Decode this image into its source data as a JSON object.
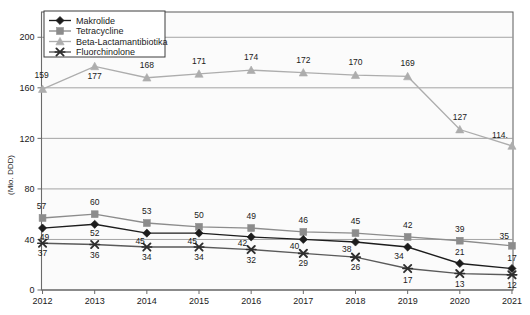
{
  "chart_data": {
    "type": "line",
    "title": "",
    "xlabel": "",
    "ylabel": "(Mio. DDD)",
    "categories": [
      "2012",
      "2013",
      "2014",
      "2015",
      "2016",
      "2017",
      "2018",
      "2019",
      "2020",
      "2021"
    ],
    "x": [
      2012,
      2013,
      2014,
      2015,
      2016,
      2017,
      2018,
      2019,
      2020,
      2021
    ],
    "ylim": [
      0,
      220
    ],
    "yticks": [
      0,
      40,
      80,
      120,
      160,
      200
    ],
    "ytick_labels": [
      "0",
      "40",
      "80",
      "120",
      "160",
      "200"
    ],
    "grid": true,
    "legend_position": "top-left",
    "series": [
      {
        "name": "Makrolide",
        "marker": "diamond",
        "color": "#1c1c1c",
        "line_color": "#1c1c1c",
        "values": [
          49,
          52,
          45,
          45,
          42,
          40,
          38,
          34,
          21,
          17
        ],
        "labels": [
          "49",
          "52",
          "45",
          "45",
          "42",
          "40",
          "38",
          "34",
          "21",
          "17"
        ]
      },
      {
        "name": "Tetracycline",
        "marker": "square",
        "color": "#8c8c8c",
        "line_color": "#8c8c8c",
        "values": [
          57,
          60,
          53,
          50,
          49,
          46,
          45,
          42,
          39,
          35
        ],
        "labels": [
          "57",
          "60",
          "53",
          "50",
          "49",
          "46",
          "45",
          "42",
          "39",
          "35"
        ]
      },
      {
        "name": "Beta-Lactamantibiotika",
        "marker": "triangle",
        "color": "#adadad",
        "line_color": "#adadad",
        "values": [
          159,
          177,
          168,
          171,
          174,
          172,
          170,
          169,
          127,
          114
        ],
        "labels": [
          "159",
          "177",
          "168",
          "171",
          "174",
          "172",
          "170",
          "169",
          "127",
          "114."
        ]
      },
      {
        "name": "Fluorchinolone",
        "marker": "x",
        "color": "#2e2e2e",
        "line_color": "#5a5a5a",
        "values": [
          37,
          36,
          34,
          34,
          32,
          29,
          26,
          17,
          13,
          12
        ],
        "labels": [
          "37",
          "36",
          "34",
          "34",
          "32",
          "29",
          "26",
          "17",
          "13",
          "12"
        ]
      }
    ]
  },
  "legend": {
    "items": [
      {
        "label": "Makrolide"
      },
      {
        "label": "Tetracycline"
      },
      {
        "label": "Beta-Lactamantibiotika"
      },
      {
        "label": "Fluorchinolone"
      }
    ]
  },
  "axes": {
    "y_axis_title": "(Mio. DDD)",
    "y_tick_labels": [
      "200",
      "160",
      "120",
      "80",
      "40",
      "0"
    ],
    "x_tick_labels": [
      "2012",
      "2013",
      "2014",
      "2015",
      "2016",
      "2017",
      "2018",
      "2019",
      "2020",
      "2021"
    ]
  },
  "colors": {
    "makrolide": "#1c1c1c",
    "tetracycline": "#8c8c8c",
    "beta_lactam": "#adadad",
    "fluorchinolone": "#2e2e2e",
    "plot_background": "#fbfbfb",
    "gridline": "#9a9a9a",
    "axis": "#6b6b6b"
  }
}
